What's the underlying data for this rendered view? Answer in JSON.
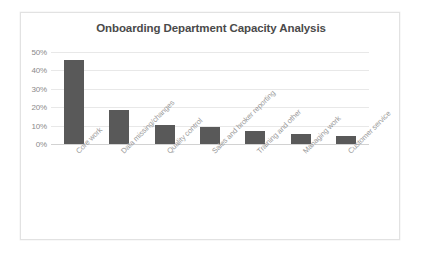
{
  "chart_data": {
    "type": "bar",
    "title": "Onboarding Department Capacity Analysis",
    "xlabel": "",
    "ylabel": "",
    "ylim": [
      0,
      50
    ],
    "ytick_labels": [
      "0%",
      "10%",
      "20%",
      "30%",
      "40%",
      "50%"
    ],
    "ytick_values": [
      0,
      10,
      20,
      30,
      40,
      50
    ],
    "grid": true,
    "legend": "none",
    "bar_color": "#595959",
    "categories": [
      "Core work",
      "Data missing/changes",
      "Quality control",
      "Sales and broker reporting",
      "Training and other",
      "Managing work",
      "Customer service"
    ],
    "values": [
      45.6,
      18.5,
      10.5,
      9.0,
      7.2,
      5.5,
      4.5
    ]
  },
  "frame": {
    "border_color": "#e2e2e2",
    "background": "#ffffff"
  }
}
